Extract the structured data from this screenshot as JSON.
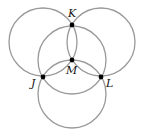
{
  "diagram": {
    "type": "geometry-construction",
    "circles": [
      {
        "name": "circle-upper-left",
        "cx": 43,
        "cy": 42,
        "r": 34
      },
      {
        "name": "circle-upper-right",
        "cx": 101,
        "cy": 42,
        "r": 34
      },
      {
        "name": "circle-center-m",
        "cx": 72,
        "cy": 60,
        "r": 34
      },
      {
        "name": "circle-lower",
        "cx": 72,
        "cy": 94,
        "r": 34
      }
    ],
    "points": [
      {
        "label": "K",
        "x": 72,
        "y": 25,
        "lx": 68,
        "ly": 17
      },
      {
        "label": "M",
        "x": 72,
        "y": 60,
        "lx": 66,
        "ly": 74
      },
      {
        "label": "J",
        "x": 43,
        "y": 77,
        "lx": 31,
        "ly": 87
      },
      {
        "label": "L",
        "x": 101,
        "y": 77,
        "lx": 106,
        "ly": 87
      }
    ],
    "colors": {
      "stroke": "#9a9a9a",
      "point": "#000000",
      "background": "#ffffff"
    }
  }
}
